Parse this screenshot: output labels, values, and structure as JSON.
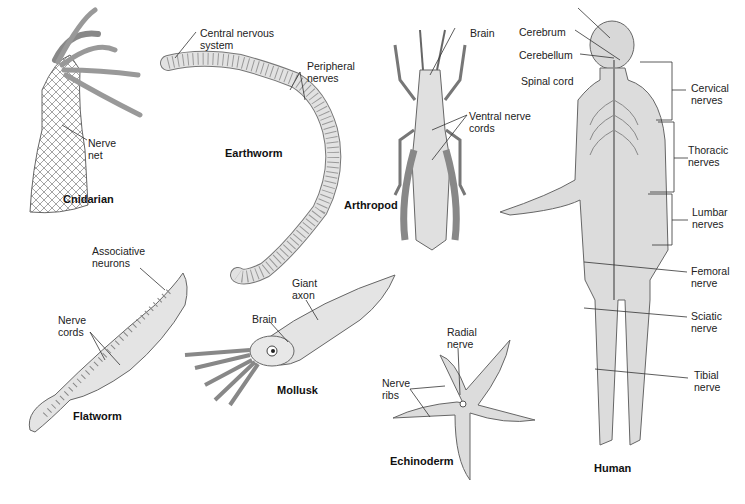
{
  "diagram": {
    "colors": {
      "fill": "#dcdcdc",
      "stroke": "#6a6a6a",
      "nerve": "#7a7a7a",
      "line": "#333333"
    },
    "organisms": [
      {
        "name": "Cnidarian",
        "labels": [
          "Nerve\nnet"
        ]
      },
      {
        "name": "Earthworm",
        "labels": [
          "Central nervous\nsystem",
          "Peripheral\nnerves"
        ]
      },
      {
        "name": "Arthropod",
        "labels": [
          "Brain",
          "Ventral nerve\ncords"
        ]
      },
      {
        "name": "Flatworm",
        "labels": [
          "Associative\nneurons",
          "Nerve\ncords"
        ]
      },
      {
        "name": "Mollusk",
        "labels": [
          "Giant\naxon",
          "Brain"
        ]
      },
      {
        "name": "Echinoderm",
        "labels": [
          "Radial\nnerve",
          "Nerve\nribs"
        ]
      },
      {
        "name": "Human",
        "labels": [
          "Cerebrum",
          "Cerebellum",
          "Spinal cord",
          "Cervical\nnerves",
          "Thoracic\nnerves",
          "Lumbar\nnerves",
          "Femoral\nnerve",
          "Sciatic\nnerve",
          "Tibial\nnerve"
        ]
      }
    ]
  }
}
